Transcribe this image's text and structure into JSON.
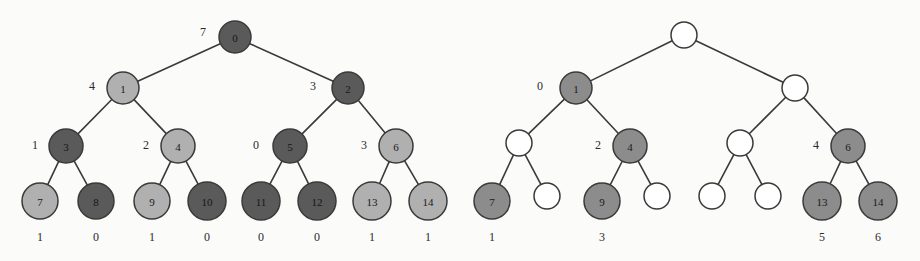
{
  "figure": {
    "background_color": "#fbfbfa",
    "edge_color": "#3a3a3a",
    "colors": {
      "dark_node": "#5a5a5a",
      "light_node": "#b0b0b0",
      "mid_node": "#8c8c8c",
      "empty_node": "#ffffff",
      "stroke": "#3a3a3a",
      "text": "#1a1a1a"
    }
  },
  "chart_data": {
    "type": "diagram",
    "panels": [
      {
        "name": "left-tree",
        "nodes": [
          {
            "id": "L0",
            "label": "0",
            "cx": 235,
            "cy": 37,
            "r": 16,
            "fill": "dark",
            "level": 0
          },
          {
            "id": "L1",
            "label": "1",
            "cx": 123,
            "cy": 88,
            "r": 16,
            "fill": "light",
            "level": 1
          },
          {
            "id": "L2",
            "label": "2",
            "cx": 348,
            "cy": 88,
            "r": 16,
            "fill": "dark",
            "level": 1
          },
          {
            "id": "L3",
            "label": "3",
            "cx": 66,
            "cy": 146,
            "r": 17,
            "fill": "dark",
            "level": 2
          },
          {
            "id": "L4",
            "label": "4",
            "cx": 178,
            "cy": 146,
            "r": 17,
            "fill": "light",
            "level": 2
          },
          {
            "id": "L5",
            "label": "5",
            "cx": 290,
            "cy": 146,
            "r": 17,
            "fill": "dark",
            "level": 2
          },
          {
            "id": "L6",
            "label": "6",
            "cx": 396,
            "cy": 146,
            "r": 17,
            "fill": "light",
            "level": 2
          },
          {
            "id": "L7",
            "label": "7",
            "cx": 40,
            "cy": 201,
            "r": 18,
            "fill": "light",
            "level": 3
          },
          {
            "id": "L8",
            "label": "8",
            "cx": 96,
            "cy": 201,
            "r": 18,
            "fill": "dark",
            "level": 3
          },
          {
            "id": "L9",
            "label": "9",
            "cx": 152,
            "cy": 201,
            "r": 18,
            "fill": "light",
            "level": 3
          },
          {
            "id": "L10",
            "label": "10",
            "cx": 207,
            "cy": 201,
            "r": 19,
            "fill": "dark",
            "level": 3
          },
          {
            "id": "L11",
            "label": "11",
            "cx": 261,
            "cy": 201,
            "r": 19,
            "fill": "dark",
            "level": 3
          },
          {
            "id": "L12",
            "label": "12",
            "cx": 317,
            "cy": 201,
            "r": 19,
            "fill": "dark",
            "level": 3
          },
          {
            "id": "L13",
            "label": "13",
            "cx": 372,
            "cy": 201,
            "r": 19,
            "fill": "light",
            "level": 3
          },
          {
            "id": "L14",
            "label": "14",
            "cx": 428,
            "cy": 201,
            "r": 19,
            "fill": "light",
            "level": 3
          }
        ],
        "edges": [
          {
            "from": "L0",
            "to": "L1"
          },
          {
            "from": "L0",
            "to": "L2"
          },
          {
            "from": "L1",
            "to": "L3"
          },
          {
            "from": "L1",
            "to": "L4"
          },
          {
            "from": "L2",
            "to": "L5"
          },
          {
            "from": "L2",
            "to": "L6"
          },
          {
            "from": "L3",
            "to": "L7"
          },
          {
            "from": "L3",
            "to": "L8"
          },
          {
            "from": "L4",
            "to": "L9"
          },
          {
            "from": "L4",
            "to": "L10"
          },
          {
            "from": "L5",
            "to": "L11"
          },
          {
            "from": "L5",
            "to": "L12"
          },
          {
            "from": "L6",
            "to": "L13"
          },
          {
            "from": "L6",
            "to": "L14"
          }
        ],
        "node_annotations": [
          {
            "text": "7",
            "x": 203,
            "y": 32,
            "for": "L0"
          },
          {
            "text": "4",
            "x": 92,
            "y": 86,
            "for": "L1"
          },
          {
            "text": "3",
            "x": 313,
            "y": 86,
            "for": "L2"
          },
          {
            "text": "1",
            "x": 35,
            "y": 145,
            "for": "L3"
          },
          {
            "text": "2",
            "x": 146,
            "y": 145,
            "for": "L4"
          },
          {
            "text": "0",
            "x": 256,
            "y": 145,
            "for": "L5"
          },
          {
            "text": "3",
            "x": 364,
            "y": 145,
            "for": "L6"
          }
        ],
        "leaf_values": [
          {
            "text": "1",
            "x": 40,
            "y": 237,
            "for": "L7"
          },
          {
            "text": "0",
            "x": 96,
            "y": 237,
            "for": "L8"
          },
          {
            "text": "1",
            "x": 152,
            "y": 237,
            "for": "L9"
          },
          {
            "text": "0",
            "x": 207,
            "y": 237,
            "for": "L10"
          },
          {
            "text": "0",
            "x": 261,
            "y": 237,
            "for": "L11"
          },
          {
            "text": "0",
            "x": 317,
            "y": 237,
            "for": "L12"
          },
          {
            "text": "1",
            "x": 372,
            "y": 237,
            "for": "L13"
          },
          {
            "text": "1",
            "x": 428,
            "y": 237,
            "for": "L14"
          }
        ]
      },
      {
        "name": "right-tree",
        "nodes": [
          {
            "id": "R0",
            "label": "",
            "cx": 684,
            "cy": 35,
            "r": 13,
            "fill": "empty",
            "level": 0
          },
          {
            "id": "R1",
            "label": "1",
            "cx": 576,
            "cy": 88,
            "r": 16,
            "fill": "mid",
            "level": 1
          },
          {
            "id": "R2",
            "label": "",
            "cx": 795,
            "cy": 88,
            "r": 13,
            "fill": "empty",
            "level": 1
          },
          {
            "id": "R3",
            "label": "",
            "cx": 519,
            "cy": 143,
            "r": 13,
            "fill": "empty",
            "level": 2
          },
          {
            "id": "R4",
            "label": "4",
            "cx": 630,
            "cy": 146,
            "r": 17,
            "fill": "mid",
            "level": 2
          },
          {
            "id": "R5",
            "label": "",
            "cx": 740,
            "cy": 143,
            "r": 13,
            "fill": "empty",
            "level": 2
          },
          {
            "id": "R6",
            "label": "6",
            "cx": 848,
            "cy": 146,
            "r": 17,
            "fill": "mid",
            "level": 2
          },
          {
            "id": "R7",
            "label": "7",
            "cx": 492,
            "cy": 201,
            "r": 18,
            "fill": "mid",
            "level": 3
          },
          {
            "id": "R8",
            "label": "",
            "cx": 547,
            "cy": 196,
            "r": 13,
            "fill": "empty",
            "level": 3
          },
          {
            "id": "R9",
            "label": "9",
            "cx": 602,
            "cy": 201,
            "r": 18,
            "fill": "mid",
            "level": 3
          },
          {
            "id": "R10",
            "label": "",
            "cx": 657,
            "cy": 196,
            "r": 13,
            "fill": "empty",
            "level": 3
          },
          {
            "id": "R11",
            "label": "",
            "cx": 712,
            "cy": 196,
            "r": 13,
            "fill": "empty",
            "level": 3
          },
          {
            "id": "R12",
            "label": "",
            "cx": 768,
            "cy": 196,
            "r": 13,
            "fill": "empty",
            "level": 3
          },
          {
            "id": "R13",
            "label": "13",
            "cx": 822,
            "cy": 201,
            "r": 19,
            "fill": "mid",
            "level": 3
          },
          {
            "id": "R14",
            "label": "14",
            "cx": 878,
            "cy": 201,
            "r": 19,
            "fill": "mid",
            "level": 3
          }
        ],
        "edges": [
          {
            "from": "R0",
            "to": "R1"
          },
          {
            "from": "R0",
            "to": "R2"
          },
          {
            "from": "R1",
            "to": "R3"
          },
          {
            "from": "R1",
            "to": "R4"
          },
          {
            "from": "R2",
            "to": "R5"
          },
          {
            "from": "R2",
            "to": "R6"
          },
          {
            "from": "R3",
            "to": "R7"
          },
          {
            "from": "R3",
            "to": "R8"
          },
          {
            "from": "R4",
            "to": "R9"
          },
          {
            "from": "R4",
            "to": "R10"
          },
          {
            "from": "R5",
            "to": "R11"
          },
          {
            "from": "R5",
            "to": "R12"
          },
          {
            "from": "R6",
            "to": "R13"
          },
          {
            "from": "R6",
            "to": "R14"
          }
        ],
        "node_annotations": [
          {
            "text": "0",
            "x": 540,
            "y": 86,
            "for": "R1"
          },
          {
            "text": "2",
            "x": 598,
            "y": 145,
            "for": "R4"
          },
          {
            "text": "4",
            "x": 816,
            "y": 145,
            "for": "R6"
          }
        ],
        "leaf_values": [
          {
            "text": "1",
            "x": 492,
            "y": 237,
            "for": "R7"
          },
          {
            "text": "3",
            "x": 602,
            "y": 237,
            "for": "R9"
          },
          {
            "text": "5",
            "x": 822,
            "y": 237,
            "for": "R13"
          },
          {
            "text": "6",
            "x": 878,
            "y": 237,
            "for": "R14"
          }
        ]
      }
    ]
  }
}
